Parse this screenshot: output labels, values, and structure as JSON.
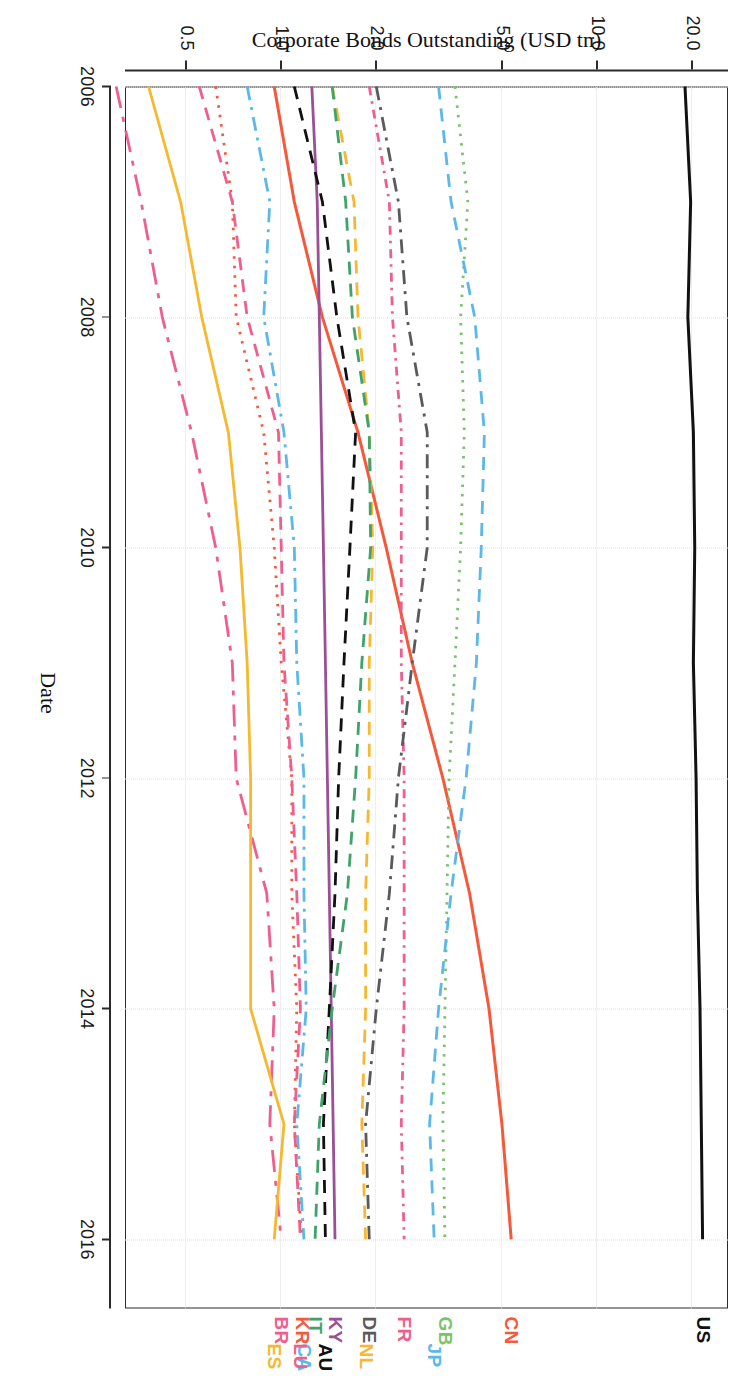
{
  "figure": {
    "xlabel": "Date",
    "ylabel": "Corporate Bonds Outstanding (USD tn)"
  },
  "chart_data": {
    "type": "line",
    "title": "",
    "subtitle": "",
    "xlabel": "Date",
    "ylabel": "Corporate Bonds Outstanding (USD tn)",
    "xlim": [
      2006,
      2016.6
    ],
    "ylim": [
      0.32,
      26.0
    ],
    "yscale": "log",
    "ytick_labels": [
      "20.0",
      "10.0",
      "5.0",
      "2.0",
      "1.0",
      "0.5"
    ],
    "ytick_values": [
      20.0,
      10.0,
      5.0,
      2.0,
      1.0,
      0.5
    ],
    "xtick_labels": [
      "2006",
      "2008",
      "2010",
      "2012",
      "2014",
      "2016"
    ],
    "xtick_values": [
      2006,
      2008,
      2010,
      2012,
      2014,
      2016
    ],
    "grid": true,
    "legend_position": "right-edge-labels",
    "x": [
      2006,
      2007,
      2008,
      2009,
      2010,
      2011,
      2012,
      2013,
      2014,
      2015,
      2016
    ],
    "series": [
      {
        "name": "US",
        "label": "US",
        "color": "#111111",
        "dash": "solid",
        "values": [
          19.0,
          19.8,
          19.4,
          20.2,
          20.4,
          20.2,
          20.6,
          20.8,
          21.2,
          21.4,
          21.6
        ]
      },
      {
        "name": "CN",
        "label": "CN",
        "color": "#f4593c",
        "dash": "solid",
        "values": [
          0.95,
          1.1,
          1.35,
          1.75,
          2.15,
          2.6,
          3.25,
          3.95,
          4.55,
          5.0,
          5.35
        ]
      },
      {
        "name": "GB",
        "label": "GB",
        "color": "#78c46a",
        "dash": "dotted",
        "values": [
          3.55,
          3.9,
          3.7,
          3.8,
          3.7,
          3.55,
          3.4,
          3.35,
          3.3,
          3.25,
          3.3
        ]
      },
      {
        "name": "JP",
        "label": "JP",
        "color": "#5bb8e8",
        "dash": "dashed",
        "values": [
          3.15,
          3.45,
          4.1,
          4.4,
          4.3,
          4.15,
          3.85,
          3.45,
          3.15,
          2.95,
          3.05
        ]
      },
      {
        "name": "FR",
        "label": "FR",
        "color": "#ef5f8d",
        "dash": "dashdot-dense",
        "values": [
          1.9,
          2.2,
          2.25,
          2.4,
          2.4,
          2.4,
          2.45,
          2.45,
          2.45,
          2.4,
          2.45
        ]
      },
      {
        "name": "NL",
        "label": "NL",
        "color": "#f7b733",
        "dash": "dashed",
        "values": [
          1.45,
          1.7,
          1.75,
          1.9,
          1.95,
          1.9,
          1.9,
          1.85,
          1.85,
          1.8,
          1.85
        ]
      },
      {
        "name": "DE",
        "label": "DE",
        "color": "#5a5a5a",
        "dash": "dashdot",
        "values": [
          2.0,
          2.35,
          2.5,
          2.9,
          2.9,
          2.6,
          2.35,
          2.2,
          2.0,
          1.85,
          1.9
        ]
      },
      {
        "name": "KY",
        "label": "KY",
        "color": "#9b4f96",
        "dash": "solid",
        "values": [
          1.25,
          1.3,
          1.32,
          1.34,
          1.36,
          1.38,
          1.4,
          1.42,
          1.44,
          1.46,
          1.48
        ]
      },
      {
        "name": "AU",
        "label": "AU",
        "color": "#111111",
        "dash": "dashed",
        "values": [
          1.1,
          1.35,
          1.5,
          1.72,
          1.65,
          1.58,
          1.52,
          1.48,
          1.42,
          1.36,
          1.38
        ]
      },
      {
        "name": "CA",
        "label": "CA",
        "color": "#5bb8e8",
        "dash": "dashdot",
        "values": [
          0.78,
          0.92,
          0.88,
          1.02,
          1.1,
          1.12,
          1.18,
          1.18,
          1.2,
          1.12,
          1.18
        ]
      },
      {
        "name": "KR",
        "label": "KR",
        "color": "#f4593c",
        "dash": "dotted",
        "values": [
          0.62,
          0.7,
          0.72,
          0.88,
          0.95,
          1.0,
          1.08,
          1.08,
          1.12,
          1.1,
          1.16
        ]
      },
      {
        "name": "IT",
        "label": "IT",
        "color": "#3fa36b",
        "dash": "dashed",
        "values": [
          1.45,
          1.6,
          1.68,
          1.9,
          1.92,
          1.8,
          1.72,
          1.62,
          1.45,
          1.32,
          1.28
        ]
      },
      {
        "name": "LU",
        "label": "LU",
        "color": "#ef5f8d",
        "dash": "dashed",
        "values": [
          0.55,
          0.7,
          0.78,
          0.98,
          1.0,
          1.02,
          1.08,
          1.12,
          1.15,
          1.1,
          1.15
        ]
      },
      {
        "name": "BR",
        "label": "BR",
        "color": "#ef5f8d",
        "dash": "longdashdot",
        "values": [
          0.3,
          0.36,
          0.42,
          0.52,
          0.62,
          0.7,
          0.72,
          0.9,
          0.95,
          0.92,
          1.0
        ]
      },
      {
        "name": "ES",
        "label": "ES",
        "color": "#f5b82e",
        "dash": "solid",
        "values": [
          0.38,
          0.48,
          0.56,
          0.68,
          0.74,
          0.78,
          0.8,
          0.8,
          0.8,
          1.02,
          0.95
        ]
      }
    ]
  }
}
